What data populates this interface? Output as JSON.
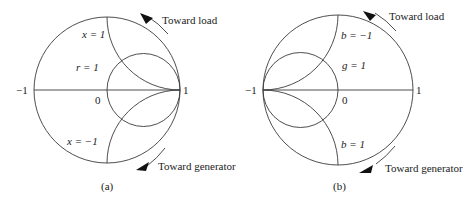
{
  "figure_a": {
    "caption": "(a)",
    "axis_labels": {
      "left": "−1",
      "center": "0",
      "right": "1"
    },
    "curve_labels": {
      "x_pos": "x = 1",
      "r": "r = 1",
      "x_neg": "x = −1"
    },
    "arrows": {
      "top": "Toward load",
      "bottom": "Toward generator"
    }
  },
  "figure_b": {
    "caption": "(b)",
    "axis_labels": {
      "left": "−1",
      "center": "0",
      "right": "1"
    },
    "curve_labels": {
      "b_neg": "b = −1",
      "g": "g = 1",
      "b_pos": "b = 1"
    },
    "arrows": {
      "top": "Toward load",
      "bottom": "Toward generator"
    }
  }
}
